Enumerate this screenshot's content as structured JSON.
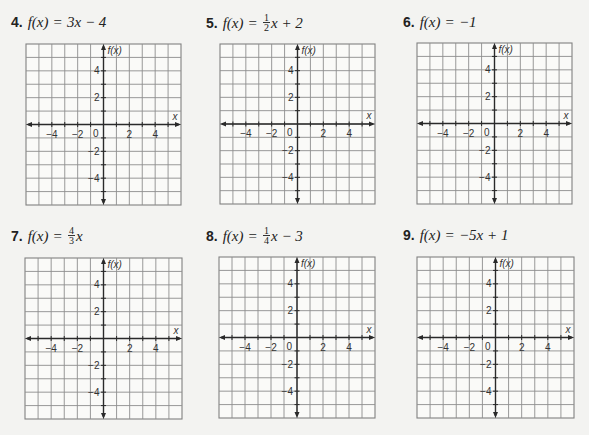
{
  "page": {
    "background": "#f3f3f1",
    "grid_color": "#8d8d8d",
    "axis_color": "#2a2a2a"
  },
  "problems": [
    {
      "number": "4.",
      "lhs": "f(x)",
      "equals": "=",
      "rhs": "3x − 4",
      "fraction": null,
      "graph": {
        "x_axis_label": "x",
        "y_axis_label": "f(x)",
        "origin_label": "0",
        "x_ticks": [
          "−4",
          "−2",
          "2",
          "4"
        ],
        "y_ticks": [
          "4",
          "2",
          "−2",
          "−4"
        ]
      },
      "box": {
        "left": 26,
        "top": 44,
        "width": 155,
        "height": 161
      },
      "title_pos": {
        "left": 11,
        "top": 13
      }
    },
    {
      "number": "5.",
      "lhs": "f(x)",
      "equals": "=",
      "rhs": "x + 2",
      "fraction": {
        "numerator": "1",
        "denominator": "2"
      },
      "graph": {
        "x_axis_label": "x",
        "y_axis_label": "f(x)",
        "origin_label": "0",
        "x_ticks": [
          "−4",
          "−2",
          "2",
          "4"
        ],
        "y_ticks": [
          "4",
          "2",
          "−2",
          "−4"
        ]
      },
      "box": {
        "left": 220,
        "top": 44,
        "width": 155,
        "height": 160
      },
      "title_pos": {
        "left": 206,
        "top": 13
      }
    },
    {
      "number": "6.",
      "lhs": "f(x)",
      "equals": "=",
      "rhs": "−1",
      "fraction": null,
      "graph": {
        "x_axis_label": "x",
        "y_axis_label": "f(x)",
        "origin_label": "0",
        "x_ticks": [
          "−4",
          "−2",
          "2",
          "4"
        ],
        "y_ticks": [
          "4",
          "2",
          "−2",
          "−4"
        ]
      },
      "box": {
        "left": 417,
        "top": 43,
        "width": 155,
        "height": 161
      },
      "title_pos": {
        "left": 403,
        "top": 13
      }
    },
    {
      "number": "7.",
      "lhs": "f(x)",
      "equals": "=",
      "rhs": "x",
      "fraction": {
        "numerator": "4",
        "denominator": "3"
      },
      "graph": {
        "x_axis_label": "x",
        "y_axis_label": "f(x)",
        "origin_label": "",
        "x_ticks": [
          "−4",
          "−2",
          "2",
          "4"
        ],
        "y_ticks": [
          "4",
          "2",
          "−2",
          "−4"
        ]
      },
      "box": {
        "left": 25,
        "top": 258,
        "width": 157,
        "height": 161
      },
      "title_pos": {
        "left": 11,
        "top": 226
      }
    },
    {
      "number": "8.",
      "lhs": "f(x)",
      "equals": "=",
      "rhs": "x − 3",
      "fraction": {
        "numerator": "1",
        "denominator": "4"
      },
      "graph": {
        "x_axis_label": "x",
        "y_axis_label": "f(x)",
        "origin_label": "0",
        "x_ticks": [
          "−4",
          "−2",
          "2",
          "4"
        ],
        "y_ticks": [
          "4",
          "2",
          "−2",
          "−4"
        ]
      },
      "box": {
        "left": 219,
        "top": 257,
        "width": 156,
        "height": 161
      },
      "title_pos": {
        "left": 206,
        "top": 226
      }
    },
    {
      "number": "9.",
      "lhs": "f(x)",
      "equals": "=",
      "rhs": "−5x + 1",
      "fraction": null,
      "graph": {
        "x_axis_label": "x",
        "y_axis_label": "f(x)",
        "origin_label": "0",
        "x_ticks": [
          "−4",
          "−2",
          "2",
          "4"
        ],
        "y_ticks": [
          "4",
          "2",
          "−2",
          "−4"
        ]
      },
      "box": {
        "left": 417,
        "top": 257,
        "width": 157,
        "height": 161
      },
      "title_pos": {
        "left": 403,
        "top": 226
      }
    }
  ]
}
